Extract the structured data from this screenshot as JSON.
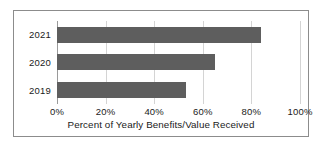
{
  "chart_data": {
    "type": "bar",
    "orientation": "horizontal",
    "title": "",
    "xlabel": "Percent of Yearly Benefits/Value Received",
    "ylabel": "",
    "categories": [
      "2021",
      "2020",
      "2019"
    ],
    "values": [
      84,
      65,
      53
    ],
    "series": [
      {
        "name": "Percent of Yearly Benefits/Value Received",
        "values": [
          84,
          65,
          53
        ]
      }
    ],
    "xlim": [
      0,
      100
    ],
    "xticks": [
      0,
      20,
      40,
      60,
      80,
      100
    ],
    "xtick_labels": [
      "0%",
      "20%",
      "40%",
      "60%",
      "80%",
      "100%"
    ],
    "grid": true,
    "legend": false,
    "bar_color": "#5e5e5e",
    "gridline_color": "#d4d4d4",
    "border_color": "#8c8c8c",
    "background_color": "#ffffff"
  }
}
